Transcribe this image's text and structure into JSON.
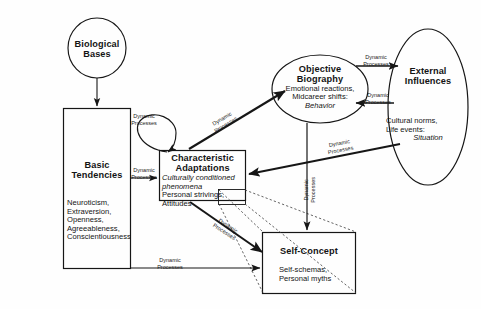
{
  "diagram": {
    "nodes": {
      "biological_bases": {
        "name": "Biological Bases",
        "title_line1": "Biological",
        "title_line2": "Bases",
        "shape": "circle"
      },
      "basic_tendencies": {
        "name": "Basic Tendencies",
        "title_line1": "Basic",
        "title_line2": "Tendencies",
        "shape": "rectangle",
        "items_line1": "Neuroticism,",
        "items_line2": "Extraversion,",
        "items_line3": "Openness,",
        "items_line4": "Agreeableness,",
        "items_line5": "Conscientiousness"
      },
      "characteristic_adaptations": {
        "name": "Characteristic Adaptations",
        "title_line1": "Characteristic",
        "title_line2": "Adaptations",
        "shape": "rectangle",
        "italic_line1": "Culturally conditioned",
        "italic_line2": "phenomena",
        "items_line1": "Personal strivings,",
        "items_line2": "Attitudes"
      },
      "objective_biography": {
        "name": "Objective Biography",
        "title_line1": "Objective",
        "title_line2": "Biography",
        "shape": "ellipse",
        "items_line1": "Emotional reactions,",
        "items_line2": "Midcareer shifts:",
        "italic_line1": "Behavior"
      },
      "external_influences": {
        "name": "External Influences",
        "title_line1": "External",
        "title_line2": "Influences",
        "shape": "ellipse",
        "items_line1": "Cultural norms,",
        "items_line2": "Life events:",
        "italic_line1": "Situation"
      },
      "self_concept": {
        "name": "Self-Concept",
        "title_line1": "Self-Concept",
        "shape": "rectangle",
        "items_line1": "Self-schemas,",
        "items_line2": "Personal myths"
      }
    },
    "edge_labels": {
      "dp_line1": "Dynamic",
      "dp_line2": "Processes",
      "bt_to_ca": {
        "line1": "Dynamic",
        "line2": "Processes"
      },
      "ca_selfloop": {
        "line1": "Dynamic",
        "line2": "Processes"
      },
      "ca_to_ob": {
        "line1": "Dynamic",
        "line2": "Processes"
      },
      "ob_to_ei": {
        "line1": "Dynamic",
        "line2": "Processes"
      },
      "ei_to_ob": {
        "line1": "Dynamic",
        "line2": "Processes"
      },
      "ei_to_ca": {
        "line1": "Dynamic",
        "line2": "Processes"
      },
      "ob_to_sc": {
        "line1": "Dynamic",
        "line2": "Processes"
      },
      "ca_to_sc": {
        "line1": "Dynamic",
        "line2": "Processes"
      },
      "bt_to_sc": {
        "line1": "Dynamic",
        "line2": "Processes"
      }
    },
    "colors": {
      "stroke": "#161616",
      "background": "#fefefe",
      "text": "#141414",
      "dashed": "#3a3a3a"
    }
  }
}
